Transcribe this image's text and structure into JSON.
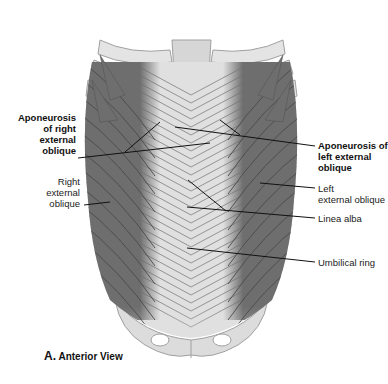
{
  "figure": {
    "caption_letter": "A.",
    "caption_text": "Anterior View",
    "colors": {
      "muscle": "#6e6e6e",
      "muscle_fiber": "#4a4a4a",
      "aponeurosis": "#e2e2e2",
      "aponeurosis_line": "#8a8a8a",
      "bone": "#d9d9d9",
      "bone_outline": "#9a9a9a",
      "leader_line": "#111111"
    },
    "labels": {
      "apo_right": "Aponeurosis\nof right\nexternal\noblique",
      "right_ext_oblique": "Right\nexternal\noblique",
      "apo_left": "Aponeurosis of\nleft external\noblique",
      "left_ext_oblique": "Left\nexternal oblique",
      "linea_alba": "Linea alba",
      "umbilical_ring": "Umbilical ring"
    }
  }
}
